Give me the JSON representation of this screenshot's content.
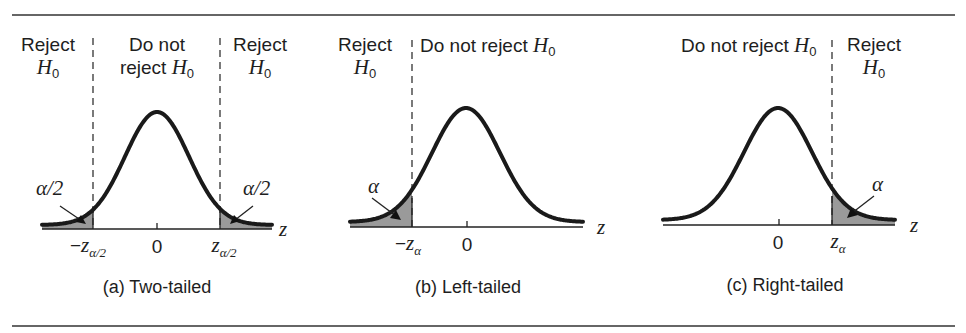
{
  "figure": {
    "rule_color": "#333333",
    "curve_color": "#1a1a1a",
    "shade_color": "#9a9a9a",
    "panels": [
      {
        "id": "a",
        "caption": "(a) Two-tailed",
        "axis_label": "z",
        "center_tick": "0",
        "regions": {
          "left_reject": {
            "line1": "Reject",
            "line2_var": "H",
            "line2_sub": "0"
          },
          "middle": {
            "line1": "Do not",
            "line2_prefix": "reject ",
            "line2_var": "H",
            "line2_sub": "0"
          },
          "right_reject": {
            "line1": "Reject",
            "line2_var": "H",
            "line2_sub": "0"
          }
        },
        "area_labels": {
          "left": "α/2",
          "right": "α/2"
        },
        "critical_labels": {
          "left": {
            "sign": "−",
            "var": "z",
            "sub": "α/2"
          },
          "right": {
            "sign": "",
            "var": "z",
            "sub": "α/2"
          }
        }
      },
      {
        "id": "b",
        "caption": "(b) Left-tailed",
        "axis_label": "z",
        "center_tick": "0",
        "regions": {
          "left_reject": {
            "line1": "Reject",
            "line2_var": "H",
            "line2_sub": "0"
          },
          "accept": {
            "prefix": "Do not reject ",
            "var": "H",
            "sub": "0"
          }
        },
        "area_labels": {
          "left": "α"
        },
        "critical_labels": {
          "left": {
            "sign": "−",
            "var": "z",
            "sub": "α"
          }
        }
      },
      {
        "id": "c",
        "caption": "(c) Right-tailed",
        "axis_label": "z",
        "center_tick": "0",
        "regions": {
          "accept": {
            "prefix": "Do not reject ",
            "var": "H",
            "sub": "0"
          },
          "right_reject": {
            "line1": "Reject",
            "line2_var": "H",
            "line2_sub": "0"
          }
        },
        "area_labels": {
          "right": "α"
        },
        "critical_labels": {
          "right": {
            "sign": "",
            "var": "z",
            "sub": "α"
          }
        }
      }
    ]
  }
}
